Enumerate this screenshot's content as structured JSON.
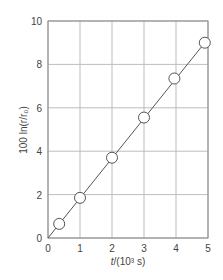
{
  "chart_data": {
    "type": "scatter",
    "title": "",
    "xlabel": "t/(10³ s)",
    "ylabel": "100 ln(r/r₀)",
    "xlim": [
      0,
      5
    ],
    "ylim": [
      0,
      10
    ],
    "grid": true,
    "x_ticks": [
      "0",
      "1",
      "2",
      "3",
      "4",
      "5"
    ],
    "y_ticks": [
      "0",
      "2",
      "4",
      "6",
      "8",
      "10"
    ],
    "series": [
      {
        "name": "data",
        "marker": "open-circle",
        "x": [
          0.35,
          1.0,
          2.0,
          3.0,
          3.95,
          4.9
        ],
        "y": [
          0.65,
          1.85,
          3.7,
          5.55,
          7.35,
          9.0
        ]
      },
      {
        "name": "fit",
        "style": "line",
        "x": [
          0,
          4.9
        ],
        "y": [
          0,
          9.0
        ]
      }
    ],
    "colors": {
      "line": "#555555",
      "grid": "#bdbdbd",
      "axis": "#777777",
      "marker_fill": "#ffffff"
    }
  },
  "axes": {
    "x_label_italic": "t",
    "x_label_rest": "/(10³ s)",
    "y_label": "100 ln(r/r₀)",
    "x_ticks": [
      "0",
      "1",
      "2",
      "3",
      "4",
      "5"
    ],
    "y_ticks": [
      "0",
      "2",
      "4",
      "6",
      "8",
      "10"
    ]
  }
}
